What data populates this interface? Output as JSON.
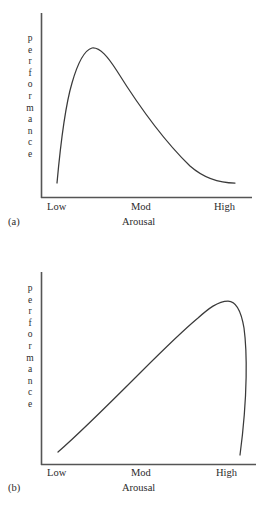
{
  "figure": {
    "ylabel_text": "performance",
    "xlabel_text": "Arousal",
    "tick_labels": [
      "Low",
      "Mod",
      "High"
    ],
    "axis_color": "#555555",
    "curve_color": "#3a3a3a",
    "background": "#ffffff"
  },
  "panels": [
    {
      "caption": "(a)",
      "ylabel": "performance",
      "xlabel": "Arousal",
      "ticks": {
        "low": "Low",
        "mod": "Mod",
        "high": "High"
      }
    },
    {
      "caption": "(b)",
      "ylabel": "performance",
      "xlabel": "Arousal",
      "ticks": {
        "low": "Low",
        "mod": "Mod",
        "high": "High"
      }
    }
  ],
  "chart_data": [
    {
      "type": "line",
      "title": "",
      "panel": "(a)",
      "xlabel": "Arousal",
      "ylabel": "performance",
      "xticks": [
        "Low",
        "Mod",
        "High"
      ],
      "xtick_values": [
        0,
        50,
        100
      ],
      "yticks": [],
      "xlim": [
        0,
        100
      ],
      "ylim": [
        0,
        100
      ],
      "grid": false,
      "legend": null,
      "description": "Inverted-U curve peaking at low-to-moderate arousal, then declining gradually and nearly linearly toward high arousal.",
      "x": [
        1,
        3,
        6,
        10,
        15,
        21,
        28,
        36,
        45,
        55,
        65,
        75,
        85,
        95,
        100
      ],
      "y": [
        8,
        30,
        55,
        72,
        83,
        89,
        91,
        89,
        84,
        76,
        66,
        54,
        41,
        27,
        20
      ]
    },
    {
      "type": "line",
      "title": "",
      "panel": "(b)",
      "xlabel": "Arousal",
      "ylabel": "performance",
      "xticks": [
        "Low",
        "Mod",
        "High"
      ],
      "xtick_values": [
        0,
        50,
        100
      ],
      "yticks": [],
      "xlim": [
        0,
        100
      ],
      "ylim": [
        0,
        100
      ],
      "grid": false,
      "legend": null,
      "description": "Inverted-U curve rising steadily from low arousal, peaking near high arousal, then dropping very steeply at the extreme.",
      "x": [
        1,
        8,
        16,
        25,
        34,
        43,
        52,
        61,
        70,
        78,
        85,
        90,
        94,
        97,
        100
      ],
      "y": [
        10,
        22,
        34,
        46,
        57,
        67,
        76,
        83,
        89,
        92,
        92,
        86,
        72,
        48,
        15
      ]
    }
  ]
}
